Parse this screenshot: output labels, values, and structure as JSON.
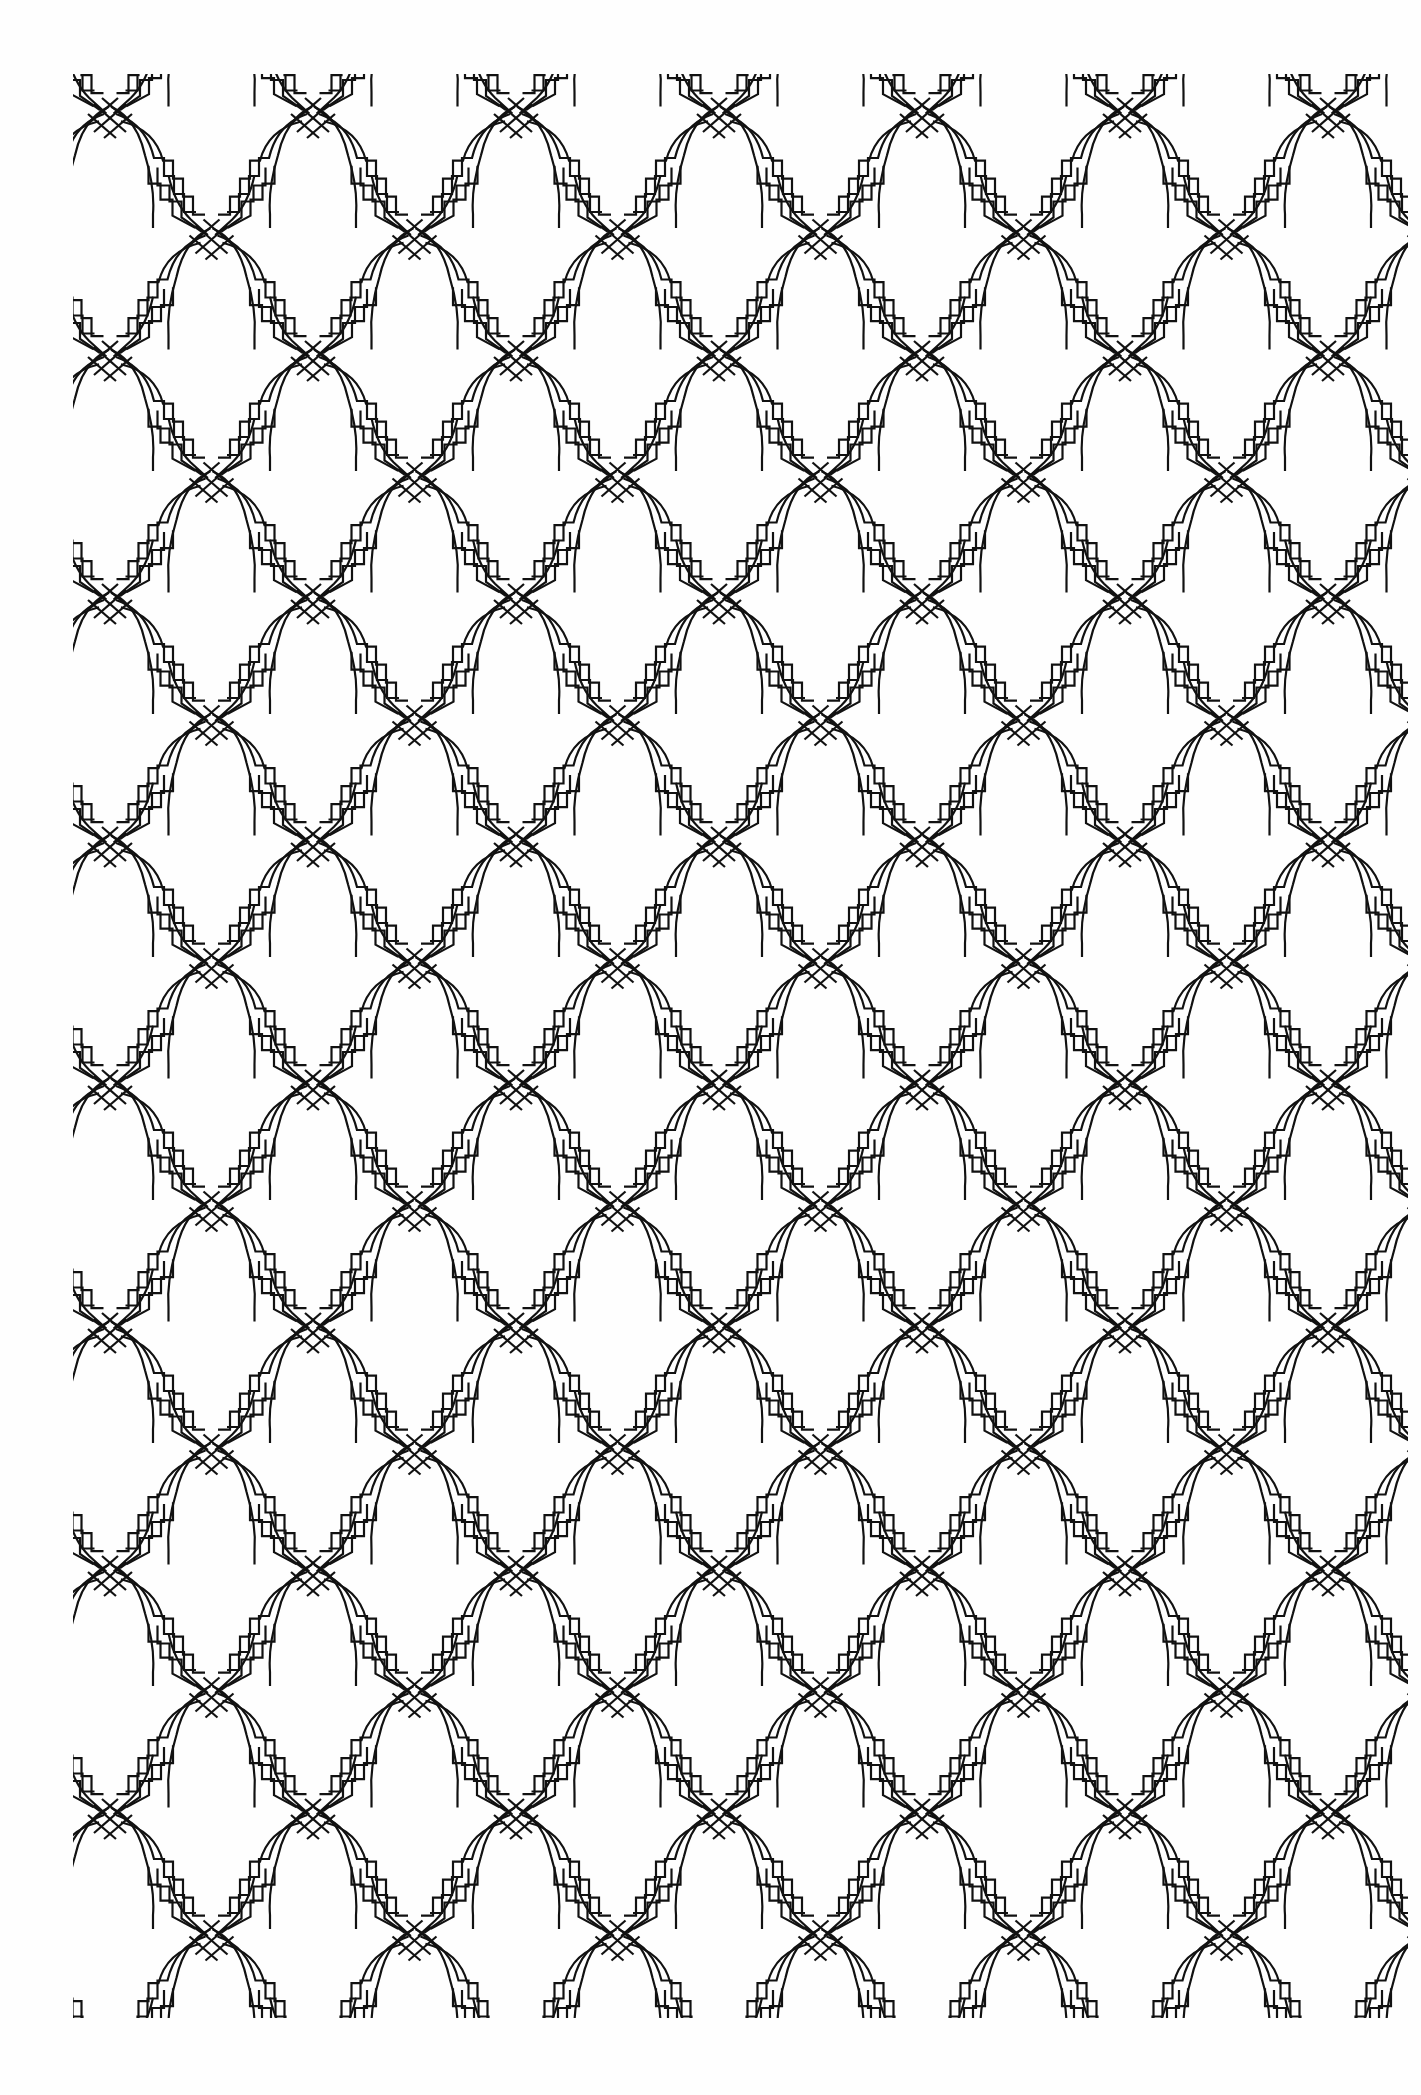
{
  "page": {
    "description": "Coloring-book page: interlaced Moorish lattice of stepped pointed arches",
    "background": "#fefefe",
    "ink": "#111111"
  },
  "pattern": {
    "type": "interlace-lattice",
    "origin_x": 73,
    "origin_y": 74,
    "width": 1335,
    "height": 1944,
    "tile_width": 203,
    "tile_height": 243,
    "tile_offset_x": 37,
    "tile_offset_y": 44,
    "band_lines": 3,
    "line_spacing": 9,
    "stroke_width": 2.2,
    "stroke_color": "#111111",
    "motifs": [
      "crossing-knot",
      "stepped-arch",
      "pointed-window",
      "quatrefoil-cell"
    ]
  }
}
